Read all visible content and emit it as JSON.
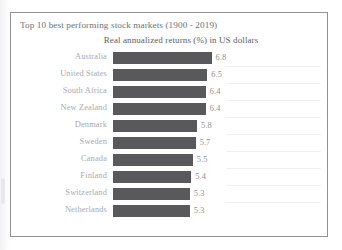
{
  "chart_data": {
    "type": "bar",
    "orientation": "horizontal",
    "title": "Top 10 best performing stock markets (1900 - 2019)",
    "subtitle": "Real annualized returns (%) in US dollars",
    "xlabel": "",
    "ylabel": "",
    "xlim": [
      0,
      8
    ],
    "grid": false,
    "legend": false,
    "bar_color": "#59595b",
    "categories": [
      "Australia",
      "United States",
      "South Africa",
      "New Zealand",
      "Denmark",
      "Sweden",
      "Canada",
      "Finland",
      "Switzerland",
      "Netherlands"
    ],
    "values": [
      6.8,
      6.5,
      6.4,
      6.4,
      5.8,
      5.7,
      5.5,
      5.4,
      5.3,
      5.3
    ],
    "value_labels": [
      "6.8",
      "6.5",
      "6.4",
      "6.4",
      "5.8",
      "5.7",
      "5.5",
      "5.4",
      "5.3",
      "5.3"
    ]
  }
}
